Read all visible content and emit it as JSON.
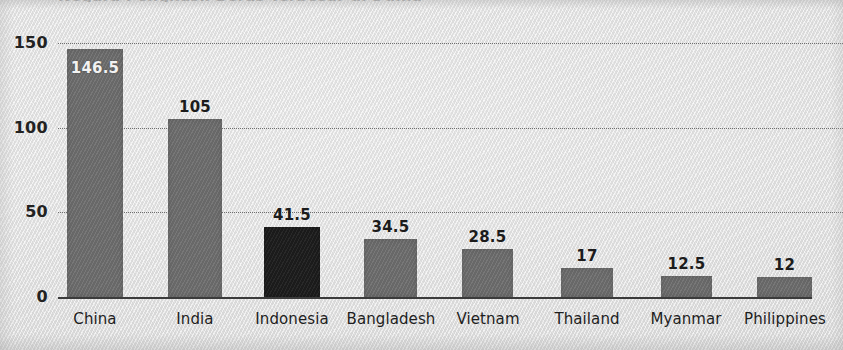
{
  "chart_data": {
    "type": "bar",
    "title": "",
    "xlabel": "",
    "ylabel": "",
    "ylim": [
      0,
      150
    ],
    "yticks": [
      0,
      50,
      100,
      150
    ],
    "ytick_labels": [
      "0",
      "50",
      "100",
      "150"
    ],
    "grid": "horizontal-dotted",
    "legend": "none",
    "categories": [
      "China",
      "India",
      "Indonesia",
      "Bangladesh",
      "Vietnam",
      "Thailand",
      "Myanmar",
      "Philippines"
    ],
    "values": [
      146.5,
      105,
      41.5,
      34.5,
      28.5,
      17,
      12.5,
      12
    ],
    "value_labels": [
      "146.5",
      "105",
      "41.5",
      "34.5",
      "28.5",
      "17",
      "12.5",
      "12"
    ],
    "highlight_index": 2,
    "bar_colors": [
      "#6e6e6e",
      "#6e6e6e",
      "#1d1d1d",
      "#6e6e6e",
      "#6e6e6e",
      "#6e6e6e",
      "#6e6e6e",
      "#6e6e6e"
    ],
    "label_inside_bar": [
      true,
      false,
      false,
      false,
      false,
      false,
      false,
      false
    ]
  },
  "style": {
    "background": "#e7e7e7",
    "bar_gray": "#6e6e6e",
    "bar_highlight": "#1d1d1d",
    "axis_color": "#3b3b3b",
    "grid_color": "#5a5a5a",
    "text_color": "#1e1e1e",
    "inside_label_color": "#f2f2f2"
  },
  "partial_title_sliver": "Negara Penghasil Beras Terbesar di Dunia"
}
